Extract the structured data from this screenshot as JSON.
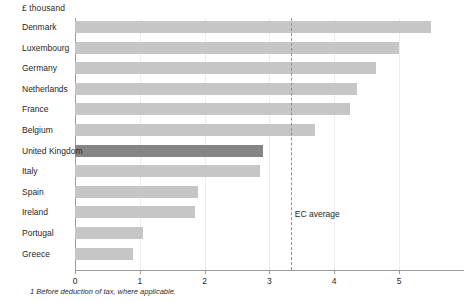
{
  "chart_data": {
    "type": "bar",
    "orientation": "horizontal",
    "title": "",
    "ylabel": "£ thousand",
    "xlabel": "",
    "categories": [
      "Denmark",
      "Luxembourg",
      "Germany",
      "Netherlands",
      "France",
      "Belgium",
      "United Kingdom",
      "Italy",
      "Spain",
      "Ireland",
      "Portugal",
      "Greece"
    ],
    "values": [
      5.5,
      5.0,
      4.65,
      4.35,
      4.25,
      3.7,
      2.9,
      2.85,
      1.9,
      1.85,
      1.05,
      0.9
    ],
    "highlight_category": "United Kingdom",
    "xlim": [
      0,
      6
    ],
    "xticks": [
      0,
      1,
      2,
      3,
      4,
      5
    ],
    "xtick_labels": [
      "0",
      "1",
      "2",
      "3",
      "4",
      "5"
    ],
    "grid": true,
    "legend": false,
    "annotations": [
      {
        "name": "ec-average",
        "label": "EC average",
        "value": 3.33,
        "style": "dashed-vertical-line"
      }
    ],
    "footnote": "1  Before deduction of tax, where applicable.",
    "colors": {
      "bar": "#c6c6c6",
      "bar_highlight": "#858585",
      "axis": "#9a9a9a",
      "gridline": "#ededed",
      "text": "#1f1f1f"
    }
  }
}
